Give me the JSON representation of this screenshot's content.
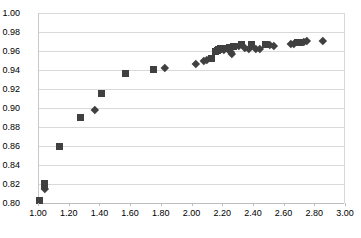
{
  "chart_data": {
    "type": "scatter",
    "title": "",
    "xlabel": "",
    "ylabel": "",
    "xlim": [
      1.0,
      3.0
    ],
    "ylim": [
      0.8,
      1.0
    ],
    "xticks": [
      "1.00",
      "1.20",
      "1.40",
      "1.60",
      "1.80",
      "2.00",
      "2.20",
      "2.40",
      "2.60",
      "2.80",
      "3.00"
    ],
    "yticks": [
      "0.80",
      "0.82",
      "0.84",
      "0.86",
      "0.88",
      "0.90",
      "0.92",
      "0.94",
      "0.96",
      "0.98",
      "1.00"
    ],
    "xtick_values": [
      1.0,
      1.2,
      1.4,
      1.6,
      1.8,
      2.0,
      2.2,
      2.4,
      2.6,
      2.8,
      3.0
    ],
    "ytick_values": [
      0.8,
      0.82,
      0.84,
      0.86,
      0.88,
      0.9,
      0.92,
      0.94,
      0.96,
      0.98,
      1.0
    ],
    "grid": "horizontal",
    "legend": "none",
    "marker_color": "#404040",
    "gridline_color": "#d9d9d9",
    "series": [
      {
        "name": "series-squares",
        "marker": "square",
        "color": "#404040",
        "points": [
          [
            1.005,
            0.803
          ],
          [
            1.037,
            0.821
          ],
          [
            1.037,
            0.818
          ],
          [
            1.132,
            0.859
          ],
          [
            1.268,
            0.89
          ],
          [
            1.405,
            0.915
          ],
          [
            1.563,
            0.936
          ],
          [
            1.748,
            0.941
          ],
          [
            2.123,
            0.952
          ],
          [
            2.15,
            0.959
          ],
          [
            2.163,
            0.961
          ],
          [
            2.172,
            0.962
          ],
          [
            2.182,
            0.963
          ],
          [
            2.195,
            0.963
          ],
          [
            2.215,
            0.963
          ],
          [
            2.24,
            0.964
          ],
          [
            2.268,
            0.965
          ],
          [
            2.318,
            0.967
          ],
          [
            2.385,
            0.967
          ],
          [
            2.478,
            0.967
          ],
          [
            2.685,
            0.969
          ],
          [
            2.7,
            0.969
          ]
        ]
      },
      {
        "name": "series-diamonds",
        "marker": "diamond",
        "color": "#404040",
        "points": [
          [
            1.04,
            0.815
          ],
          [
            1.363,
            0.898
          ],
          [
            1.818,
            0.942
          ],
          [
            2.02,
            0.947
          ],
          [
            2.072,
            0.95
          ],
          [
            2.09,
            0.951
          ],
          [
            2.205,
            0.961
          ],
          [
            2.232,
            0.962
          ],
          [
            2.248,
            0.959
          ],
          [
            2.258,
            0.957
          ],
          [
            2.3,
            0.965
          ],
          [
            2.34,
            0.963
          ],
          [
            2.368,
            0.962
          ],
          [
            2.412,
            0.962
          ],
          [
            2.44,
            0.962
          ],
          [
            2.505,
            0.967
          ],
          [
            2.53,
            0.966
          ],
          [
            2.64,
            0.968
          ],
          [
            2.66,
            0.968
          ],
          [
            2.728,
            0.97
          ],
          [
            2.742,
            0.971
          ],
          [
            2.85,
            0.971
          ]
        ]
      }
    ]
  }
}
